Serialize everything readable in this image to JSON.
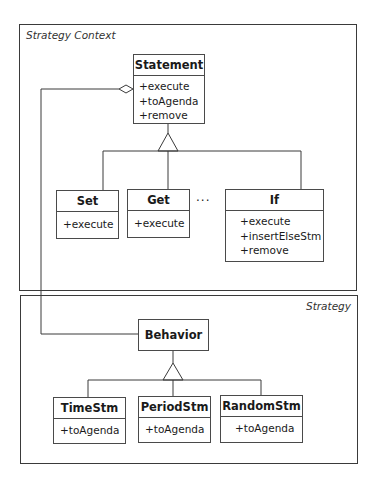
{
  "diagram": {
    "frames": [
      {
        "id": "strategy-context",
        "label": "Strategy Context"
      },
      {
        "id": "strategy",
        "label": "Strategy"
      }
    ],
    "classes": {
      "statement": {
        "name": "Statement",
        "ops": [
          "+execute",
          "+toAgenda",
          "+remove"
        ]
      },
      "set": {
        "name": "Set",
        "ops": [
          "+execute"
        ]
      },
      "get": {
        "name": "Get",
        "ops": [
          "+execute"
        ]
      },
      "if": {
        "name": "If",
        "ops": [
          "+execute",
          "+insertElseStm",
          "+remove"
        ]
      },
      "behavior": {
        "name": "Behavior",
        "ops": []
      },
      "timestm": {
        "name": "TimeStm",
        "ops": [
          "+toAgenda"
        ]
      },
      "periodstm": {
        "name": "PeriodStm",
        "ops": [
          "+toAgenda"
        ]
      },
      "randomstm": {
        "name": "RandomStm",
        "ops": [
          "+toAgenda"
        ]
      }
    },
    "ellipsis": "···",
    "relationships": [
      {
        "type": "generalization",
        "parent": "Statement",
        "children": [
          "Set",
          "Get",
          "If"
        ]
      },
      {
        "type": "generalization",
        "parent": "Behavior",
        "children": [
          "TimeStm",
          "PeriodStm",
          "RandomStm"
        ]
      },
      {
        "type": "aggregation",
        "whole": "Statement",
        "part": "Behavior"
      }
    ],
    "colors": {
      "line": "#3a3a3a",
      "background": "#ffffff",
      "text": "#1a1a1a"
    }
  }
}
